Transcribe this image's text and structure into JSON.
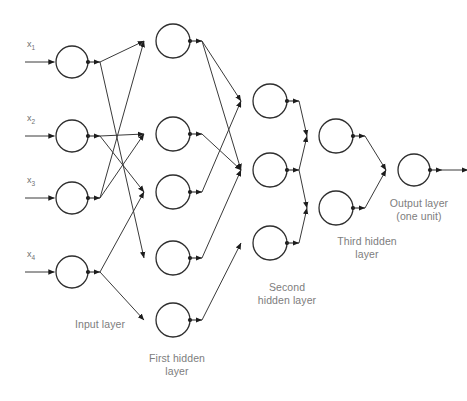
{
  "figure": {
    "stroke_color": "#3a3a3a",
    "node_stroke_color": "#2e2e2e",
    "label_color": "#7d7d7d",
    "background_color": "#ffffff"
  },
  "inputs": [
    {
      "label": "x",
      "sub": "1"
    },
    {
      "label": "x",
      "sub": "2"
    },
    {
      "label": "x",
      "sub": "3"
    },
    {
      "label": "x",
      "sub": "4"
    }
  ],
  "layer_labels": {
    "input": "Input layer",
    "first_hidden": "First hidden\nlayer",
    "second_hidden": "Second\nhidden layer",
    "third_hidden": "Third hidden\nlayer",
    "output": "Output layer\n(one unit)"
  },
  "chart_data": {
    "type": "diagram",
    "diagram_kind": "neural-network",
    "layers": [
      {
        "name": "Input layer",
        "id": "input",
        "unit_count": 4,
        "nodes": [
          {
            "id": "i1",
            "cx": 72,
            "cy": 62,
            "r": 16
          },
          {
            "id": "i2",
            "cx": 72,
            "cy": 136,
            "r": 16
          },
          {
            "id": "i3",
            "cx": 72,
            "cy": 198,
            "r": 16
          },
          {
            "id": "i4",
            "cx": 72,
            "cy": 272,
            "r": 16
          }
        ]
      },
      {
        "name": "First hidden layer",
        "id": "hidden1",
        "unit_count": 5,
        "nodes": [
          {
            "id": "h1a",
            "cx": 173,
            "cy": 41,
            "r": 17
          },
          {
            "id": "h1b",
            "cx": 173,
            "cy": 134,
            "r": 17
          },
          {
            "id": "h1c",
            "cx": 173,
            "cy": 192,
            "r": 17
          },
          {
            "id": "h1d",
            "cx": 173,
            "cy": 258,
            "r": 17
          },
          {
            "id": "h1e",
            "cx": 173,
            "cy": 320,
            "r": 17
          }
        ]
      },
      {
        "name": "Second hidden layer",
        "id": "hidden2",
        "unit_count": 3,
        "nodes": [
          {
            "id": "h2a",
            "cx": 270,
            "cy": 101,
            "r": 17
          },
          {
            "id": "h2b",
            "cx": 270,
            "cy": 170,
            "r": 17
          },
          {
            "id": "h2c",
            "cx": 270,
            "cy": 243,
            "r": 17
          }
        ]
      },
      {
        "name": "Third hidden layer",
        "id": "hidden3",
        "unit_count": 2,
        "nodes": [
          {
            "id": "h3a",
            "cx": 336,
            "cy": 136,
            "r": 17
          },
          {
            "id": "h3b",
            "cx": 336,
            "cy": 208,
            "r": 17
          }
        ]
      },
      {
        "name": "Output layer",
        "id": "output",
        "unit_count": 1,
        "nodes": [
          {
            "id": "o1",
            "cx": 414,
            "cy": 170,
            "r": 16
          }
        ]
      }
    ],
    "edges": [
      {
        "from": "x1",
        "to": "i1"
      },
      {
        "from": "x2",
        "to": "i2"
      },
      {
        "from": "x3",
        "to": "i3"
      },
      {
        "from": "x4",
        "to": "i4"
      },
      {
        "from": "i1",
        "to": "h1a"
      },
      {
        "from": "i1",
        "to": "h1d"
      },
      {
        "from": "i2",
        "to": "h1b"
      },
      {
        "from": "i2",
        "to": "h1c"
      },
      {
        "from": "i3",
        "to": "h1a"
      },
      {
        "from": "i3",
        "to": "h1b"
      },
      {
        "from": "i4",
        "to": "h1c"
      },
      {
        "from": "i4",
        "to": "h1e"
      },
      {
        "from": "h1a",
        "to": "h2a"
      },
      {
        "from": "h1a",
        "to": "h2b"
      },
      {
        "from": "h1b",
        "to": "h2b"
      },
      {
        "from": "h1c",
        "to": "h2a"
      },
      {
        "from": "h1d",
        "to": "h2b"
      },
      {
        "from": "h1e",
        "to": "h2c"
      },
      {
        "from": "h2a",
        "to": "h3a"
      },
      {
        "from": "h2b",
        "to": "h3a"
      },
      {
        "from": "h2b",
        "to": "h3b"
      },
      {
        "from": "h2c",
        "to": "h3b"
      },
      {
        "from": "h3a",
        "to": "o1"
      },
      {
        "from": "h3b",
        "to": "o1"
      },
      {
        "from": "o1",
        "to": "output-arrow"
      }
    ],
    "label_positions": {
      "input": {
        "x": 60,
        "y": 318
      },
      "first_hidden": {
        "x": 137,
        "y": 352
      },
      "second_hidden": {
        "x": 248,
        "y": 281
      },
      "third_hidden": {
        "x": 325,
        "y": 235
      },
      "output": {
        "x": 379,
        "y": 197
      }
    }
  }
}
